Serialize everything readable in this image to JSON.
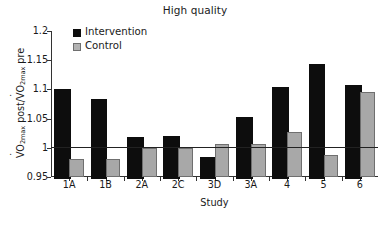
{
  "chart_data": {
    "type": "bar",
    "title": "High quality",
    "xlabel": "Study",
    "ylabel": "VO2max post/VO2max pre",
    "ylabel_parts": {
      "v1": "V",
      "sub1": "O",
      "sub1b": "2max",
      "mid": " post/",
      "v2": "V",
      "sub2": "O",
      "sub2b": "2max",
      "end": " pre"
    },
    "categories": [
      "1A",
      "1B",
      "2A",
      "2C",
      "3D",
      "3A",
      "4",
      "5",
      "6"
    ],
    "series": [
      {
        "name": "Intervention",
        "color": "#0d0d0d",
        "values": [
          1.1,
          1.084,
          1.018,
          1.02,
          0.985,
          1.052,
          1.104,
          1.143,
          1.107
        ]
      },
      {
        "name": "Control",
        "color": "#a8a8a8",
        "values": [
          0.981,
          0.981,
          1.0,
          1.0,
          1.006,
          1.007,
          1.027,
          0.987,
          1.095
        ]
      }
    ],
    "ylim": [
      0.95,
      1.2
    ],
    "yticks": [
      0.95,
      1,
      1.05,
      1.1,
      1.15,
      1.2
    ],
    "ytick_labels": [
      "0.95",
      "1",
      "1.05",
      "1.1",
      "1.15",
      "1.2"
    ],
    "reference_line": 1.0,
    "baseline": 0.95,
    "grid": false,
    "legend_position": "upper-left-inside"
  }
}
